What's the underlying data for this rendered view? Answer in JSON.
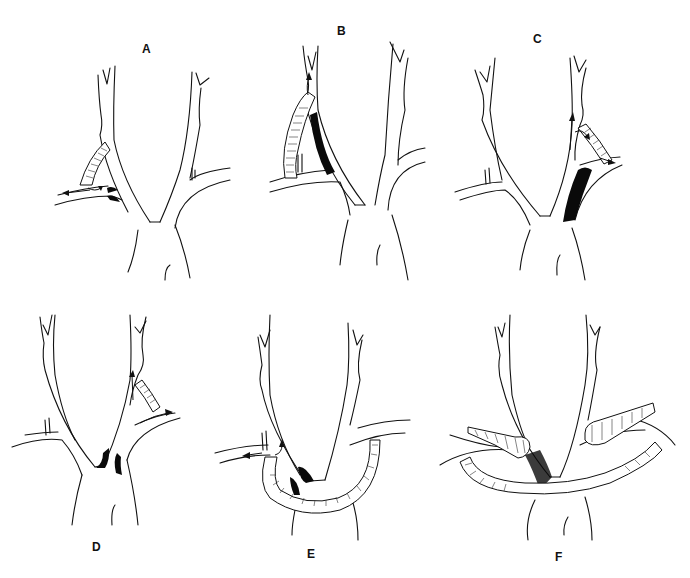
{
  "figure": {
    "panels": [
      {
        "id": "A",
        "label": "A",
        "description": "Carotid-subclavian bypass graft from subclavian to common carotid with proximal subclavian occlusion; arrows show flow direction"
      },
      {
        "id": "B",
        "label": "B",
        "description": "Subclavian-carotid bypass graft with long common carotid occlusion (solid black segment)"
      },
      {
        "id": "C",
        "label": "C",
        "description": "Carotid-subclavian bypass on right with proximal innominate/subclavian occlusion; arrows show flow"
      },
      {
        "id": "D",
        "label": "D",
        "description": "Short carotid-subclavian graft with origin stenoses; arrows indicate flow"
      },
      {
        "id": "E",
        "label": "E",
        "description": "Crossover subclavian-to-subclavian looped graft around aortic arch with origin occlusions"
      },
      {
        "id": "F",
        "label": "F",
        "description": "Bilateral bypass graft across arch with hatched proximal segments and stippled occlusion"
      }
    ],
    "colors": {
      "line": "#111111",
      "occlusion": "#0a0a0a",
      "background": "#ffffff"
    }
  }
}
